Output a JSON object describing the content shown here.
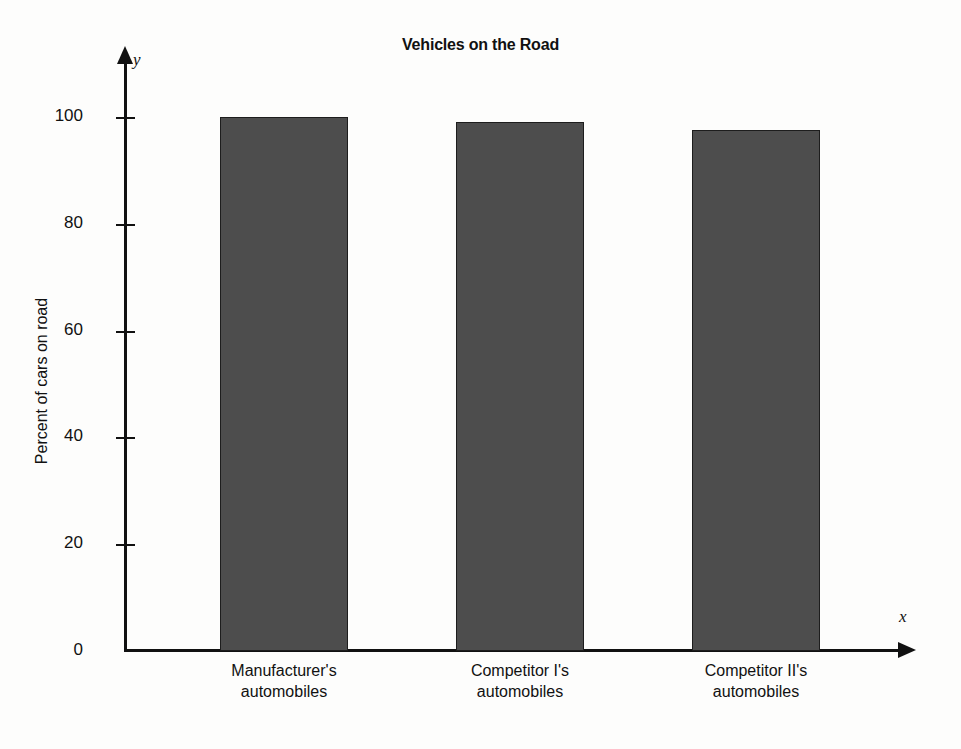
{
  "chart_data": {
    "type": "bar",
    "title": "Vehicles on the Road",
    "xlabel": "x",
    "ylabel": "Percent of cars on road",
    "categories": [
      "Manufacturer's automobiles",
      "Competitor I's automobiles",
      "Competitor II's automobiles"
    ],
    "category_lines": [
      [
        "Manufacturer's",
        "automobiles"
      ],
      [
        "Competitor I's",
        "automobiles"
      ],
      [
        "Competitor II's",
        "automobiles"
      ]
    ],
    "values": [
      100,
      99,
      97.5
    ],
    "ylim": [
      0,
      107
    ],
    "yticks": [
      0,
      20,
      40,
      60,
      80,
      100
    ],
    "ytick_labels": [
      "0",
      "20",
      "40",
      "60",
      "80",
      "100"
    ],
    "grid": false,
    "legend": null,
    "axis_letters": {
      "x": "x",
      "y": "y"
    },
    "colors": {
      "bar_fill": "#4d4d4d",
      "bar_edge": "#1d1d1d",
      "axis": "#111111",
      "background": "#fdfdfc",
      "text": "#111111"
    }
  }
}
